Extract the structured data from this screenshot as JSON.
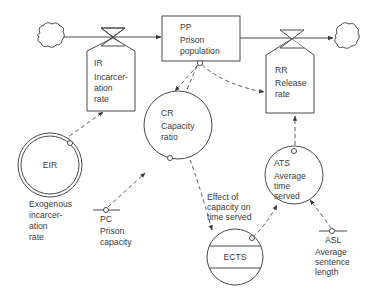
{
  "diagram": {
    "type": "system-dynamics-flow-diagram",
    "levels": [
      {
        "id": "PP",
        "abbr": "PP",
        "label_lines": [
          "Prison",
          "population"
        ]
      }
    ],
    "rates": [
      {
        "id": "IR",
        "abbr": "IR",
        "label_lines": [
          "Incarcer-",
          "ation",
          "rate"
        ]
      },
      {
        "id": "RR",
        "abbr": "RR",
        "label_lines": [
          "Release",
          "rate"
        ]
      }
    ],
    "auxiliaries": [
      {
        "id": "CR",
        "abbr": "CR",
        "label_lines": [
          "Capacity",
          "ratio"
        ]
      },
      {
        "id": "ATS",
        "abbr": "ATS",
        "label_lines": [
          "Average",
          "time",
          "served"
        ]
      },
      {
        "id": "ECTS",
        "abbr": "ECTS",
        "caption_lines": [
          "Effect of",
          "capacity on",
          "time served"
        ]
      }
    ],
    "exogenous": [
      {
        "id": "EIR",
        "abbr": "EIR",
        "caption_lines": [
          "Exogenous",
          "incarcer-",
          "ation",
          "rate"
        ]
      }
    ],
    "constants": [
      {
        "id": "PC",
        "abbr": "PC",
        "caption_lines": [
          "Prison",
          "capacity"
        ]
      },
      {
        "id": "ASL",
        "abbr": "ASL",
        "caption_lines": [
          "Average",
          "sentence",
          "length"
        ]
      }
    ],
    "flows": [
      {
        "from": "source-cloud",
        "to": "PP",
        "via": "IR"
      },
      {
        "from": "PP",
        "to": "sink-cloud",
        "via": "RR"
      }
    ],
    "information_links": [
      {
        "from": "EIR",
        "to": "IR"
      },
      {
        "from": "PP",
        "to": "CR"
      },
      {
        "from": "PP",
        "to": "RR"
      },
      {
        "from": "PC",
        "to": "CR"
      },
      {
        "from": "CR",
        "to": "ECTS"
      },
      {
        "from": "ECTS",
        "to": "ATS"
      },
      {
        "from": "ASL",
        "to": "ATS"
      },
      {
        "from": "ATS",
        "to": "RR"
      }
    ]
  }
}
